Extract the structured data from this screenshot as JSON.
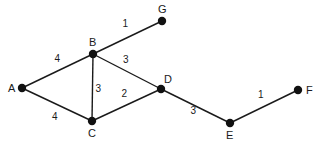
{
  "diagram": {
    "type": "weighted-undirected-graph",
    "nodes": [
      {
        "id": "A",
        "label": "A"
      },
      {
        "id": "B",
        "label": "B"
      },
      {
        "id": "C",
        "label": "C"
      },
      {
        "id": "D",
        "label": "D"
      },
      {
        "id": "E",
        "label": "E"
      },
      {
        "id": "F",
        "label": "F"
      },
      {
        "id": "G",
        "label": "G"
      }
    ],
    "edges": [
      {
        "from": "A",
        "to": "B",
        "weight": "4"
      },
      {
        "from": "A",
        "to": "C",
        "weight": "4"
      },
      {
        "from": "B",
        "to": "C",
        "weight": "3"
      },
      {
        "from": "B",
        "to": "D",
        "weight": "3"
      },
      {
        "from": "B",
        "to": "G",
        "weight": "1"
      },
      {
        "from": "C",
        "to": "D",
        "weight": "2"
      },
      {
        "from": "D",
        "to": "E",
        "weight": "3"
      },
      {
        "from": "E",
        "to": "F",
        "weight": "1"
      }
    ]
  }
}
